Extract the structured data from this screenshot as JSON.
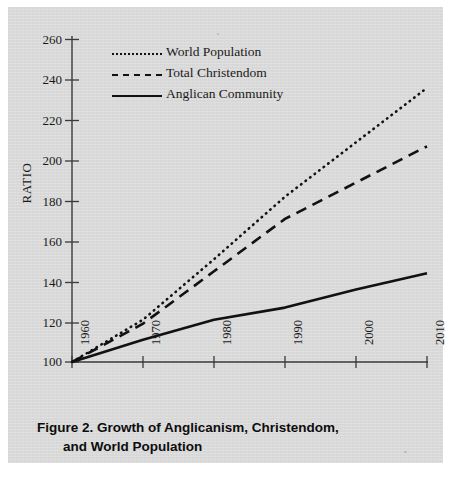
{
  "figure": {
    "caption_line_1": "Figure 2. Growth of Anglicanism, Christendom,",
    "caption_line_2": "and World Population",
    "background_color": "#d9d9d9",
    "ink_color": "#111111"
  },
  "chart_data": {
    "type": "line",
    "title": "Figure 2. Growth of Anglicanism, Christendom, and World Population",
    "xlabel": "",
    "ylabel": "RATIO",
    "x": [
      1960,
      1970,
      1980,
      1990,
      2000,
      2010
    ],
    "categories": [
      "1960",
      "1970",
      "1980",
      "1990",
      "2000",
      "2010"
    ],
    "xlim": [
      1960,
      2010
    ],
    "ylim": [
      100,
      260
    ],
    "y_ticks": [
      100,
      120,
      140,
      160,
      180,
      200,
      220,
      240,
      260
    ],
    "x_ticks": [
      1960,
      1970,
      1980,
      1990,
      2000,
      2010
    ],
    "grid": false,
    "legend_position": "top-left",
    "series": [
      {
        "name": "World Population",
        "style": "dotted",
        "color": "#111111",
        "values": [
          100,
          121,
          151,
          182,
          209,
          236
        ]
      },
      {
        "name": "Total Christendom",
        "style": "dashed",
        "color": "#111111",
        "values": [
          100,
          119,
          145,
          171,
          189,
          207
        ]
      },
      {
        "name": "Anglican Community",
        "style": "solid",
        "color": "#111111",
        "values": [
          100,
          111,
          121,
          127,
          136,
          144
        ]
      }
    ]
  },
  "axis": {
    "y_title": "RATIO",
    "y_tick_labels": [
      "260",
      "240",
      "220",
      "200",
      "180",
      "160",
      "140",
      "120",
      "100"
    ],
    "x_tick_labels": [
      "1960",
      "1970",
      "1980",
      "1990",
      "2000",
      "2010"
    ]
  },
  "legend": {
    "items": [
      {
        "label": "World Population",
        "style": "dotted"
      },
      {
        "label": "Total Christendom",
        "style": "dashed"
      },
      {
        "label": "Anglican Community",
        "style": "solid"
      }
    ]
  }
}
